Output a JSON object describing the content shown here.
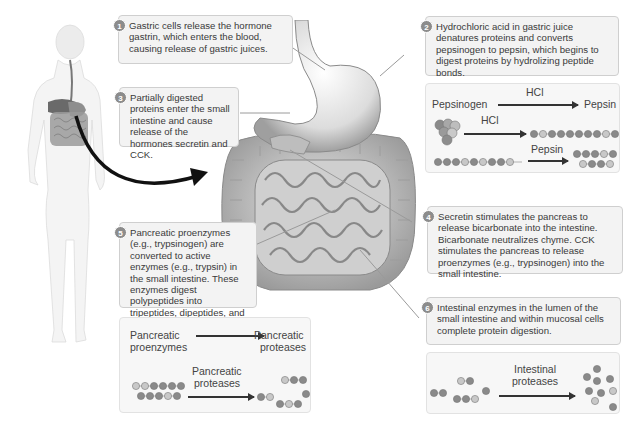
{
  "steps": [
    {
      "num": "1",
      "text": "Gastric cells release the hormone gastrin, which enters the blood, causing release of gastric juices."
    },
    {
      "num": "2",
      "text": "Hydrochloric acid in gastric juice denatures proteins and converts pepsinogen to pepsin, which begins to digest proteins by hydrolizing peptide bonds."
    },
    {
      "num": "3",
      "text": "Partially digested proteins enter the small intestine and cause release of the hormones secretin and CCK."
    },
    {
      "num": "4",
      "text": "Secretin stimulates the pancreas to release bicarbonate into the intestine. Bicarbonate neutralizes chyme. CCK stimulates the pancreas to release proenzymes (e.g., trypsinogen) into the small intestine."
    },
    {
      "num": "5",
      "text": "Pancreatic proenzymes (e.g., trypsinogen) are converted to active enzymes (e.g., trypsin) in the small intestine. These enzymes digest polypeptides into tripeptides, dipeptides, and free amino acids"
    },
    {
      "num": "6",
      "text": "Intestinal enzymes in the lumen of the small intestine and within mucosal cells complete protein digestion."
    }
  ],
  "stomach_panel": {
    "row1_left": "Pepsinogen",
    "row1_arrow": "HCl",
    "row1_right": "Pepsin",
    "row2_arrow": "HCl",
    "row3_arrow": "Pepsin"
  },
  "pancreas_panel": {
    "row1_left_line1": "Pancreatic",
    "row1_left_line2": "proenzymes",
    "row1_right_line1": "Pancreatic",
    "row1_right_line2": "proteases",
    "row2_arrow_line1": "Pancreatic",
    "row2_arrow_line2": "proteases"
  },
  "intestine_panel": {
    "arrow_line1": "Intestinal",
    "arrow_line2": "proteases"
  },
  "colors": {
    "box_bg": "#f3f3f3",
    "box_border": "#cfcfcf",
    "bead_dark": "#8a8a8a",
    "bead_light": "#c8c8c8",
    "arrow": "#222222"
  }
}
